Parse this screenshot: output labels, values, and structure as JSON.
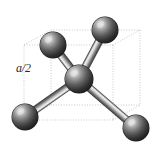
{
  "figure": {
    "kind": "diamond-cubic-tetrahedral-bond-diagram",
    "canvas": {
      "width": 163,
      "height": 149,
      "background": "#ffffff"
    },
    "labels": {
      "lattice_half_edge": "a/2",
      "lattice_half_edge_x": 16,
      "lattice_half_edge_y": 62
    },
    "colors": {
      "sphere_dark": "#2b2b2b",
      "sphere_mid": "#6a6a6a",
      "sphere_highlight": "#e8e8e8",
      "sphere_outline": "#1a1a1a",
      "bond_light": "#f2f2f2",
      "bond_mid": "#9a9a9a",
      "bond_dark": "#4e4e4e",
      "cube_edge": "#b9b9b9",
      "label_text": "#2a2a2a"
    },
    "cube": {
      "description": "dotted cubic cell wireframe in oblique projection",
      "vertices": {
        "front_top_left": [
          24,
          45
        ],
        "front_top_right": [
          113,
          45
        ],
        "front_bottom_left": [
          24,
          120
        ],
        "front_bottom_right": [
          113,
          120
        ],
        "back_top_left": [
          51,
          30
        ],
        "back_top_right": [
          140,
          30
        ],
        "back_bottom_left": [
          51,
          105
        ],
        "back_bottom_right": [
          140,
          105
        ]
      },
      "edges": [
        [
          "front_top_left",
          "front_top_right"
        ],
        [
          "front_top_right",
          "front_bottom_right"
        ],
        [
          "front_bottom_right",
          "front_bottom_left"
        ],
        [
          "front_bottom_left",
          "front_top_left"
        ],
        [
          "back_top_left",
          "back_top_right"
        ],
        [
          "back_top_right",
          "back_bottom_right"
        ],
        [
          "back_bottom_right",
          "back_bottom_left"
        ],
        [
          "back_bottom_left",
          "back_top_left"
        ],
        [
          "front_top_left",
          "back_top_left"
        ],
        [
          "front_top_right",
          "back_top_right"
        ],
        [
          "front_bottom_left",
          "back_bottom_left"
        ],
        [
          "front_bottom_right",
          "back_bottom_right"
        ]
      ]
    },
    "atoms": [
      {
        "id": "atom-center",
        "cx": 79,
        "cy": 79,
        "r": 14,
        "role": "central-atom"
      },
      {
        "id": "atom-top-left",
        "cx": 53,
        "cy": 45,
        "r": 13,
        "role": "corner-atom"
      },
      {
        "id": "atom-top-right",
        "cx": 105,
        "cy": 30,
        "r": 13,
        "role": "corner-atom"
      },
      {
        "id": "atom-bottom-left",
        "cx": 25,
        "cy": 117,
        "r": 13,
        "role": "corner-atom"
      },
      {
        "id": "atom-bottom-right",
        "cx": 136,
        "cy": 128,
        "r": 13,
        "role": "corner-atom"
      }
    ],
    "bonds": [
      {
        "id": "bond-center-top-left",
        "from": "atom-center",
        "to": "atom-top-left",
        "width": 7
      },
      {
        "id": "bond-center-top-right",
        "from": "atom-center",
        "to": "atom-top-right",
        "width": 7
      },
      {
        "id": "bond-center-bottom-left",
        "from": "atom-center",
        "to": "atom-bottom-left",
        "width": 7
      },
      {
        "id": "bond-center-bottom-right",
        "from": "atom-center",
        "to": "atom-bottom-right",
        "width": 7
      }
    ]
  }
}
